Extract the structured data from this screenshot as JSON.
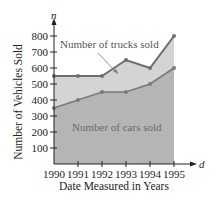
{
  "chart_data": {
    "type": "area",
    "title": "",
    "xlabel": "Date Measured in Years",
    "ylabel": "Number of Vehicles Sold",
    "x_axis_variable": "d",
    "y_axis_variable": "n",
    "categories": [
      "1990",
      "1991",
      "1992",
      "1993",
      "1994",
      "1995"
    ],
    "series": [
      {
        "name": "Number of cars sold",
        "values": [
          350,
          400,
          450,
          450,
          500,
          600
        ],
        "color": "#b5b5b5",
        "line_color": "#7a7a7a"
      },
      {
        "name": "Number of trucks sold",
        "values": [
          550,
          550,
          550,
          650,
          600,
          800
        ],
        "color": "#d4d4d4",
        "line_color": "#6e6e6e"
      }
    ],
    "y_ticks": [
      100,
      200,
      300,
      400,
      500,
      600,
      700,
      800
    ],
    "ylim": [
      0,
      850
    ],
    "grid": false,
    "legend": "inline annotations",
    "annotations": [
      "Number of trucks sold",
      "Number of cars sold"
    ]
  },
  "labels": {
    "y_var": "n",
    "x_var": "d",
    "ylabel": "Number of Vehicles Sold",
    "xlabel": "Date Measured in Years",
    "trucks": "Number of trucks sold",
    "cars": "Number of cars sold"
  }
}
